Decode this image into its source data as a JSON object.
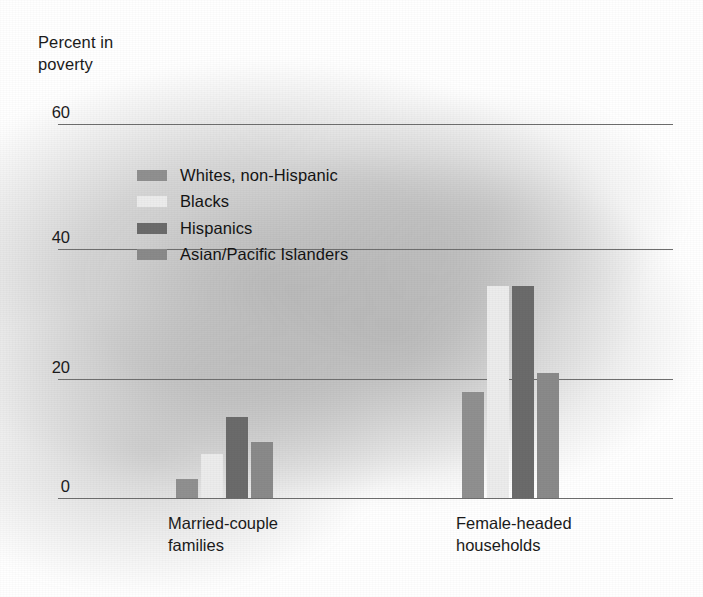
{
  "chart_data": {
    "type": "bar",
    "title": "Percent in poverty",
    "xlabel": "",
    "ylabel": "Percent in poverty",
    "ylim": [
      0,
      60
    ],
    "yticks": [
      0,
      20,
      40,
      60
    ],
    "ytick_labels": [
      "0",
      "20",
      "40",
      "60"
    ],
    "grid": true,
    "legend_position": "upper-left-inside",
    "categories": [
      "Married-couple\nfamilies",
      "Female-headed\nhouseholds"
    ],
    "category_labels": [
      "Married-couple families",
      "Female-headed households"
    ],
    "series": [
      {
        "name": "Whites, non-Hispanic",
        "color": "#909090",
        "values": [
          3,
          17
        ]
      },
      {
        "name": "Blacks",
        "color": "#ececec",
        "values": [
          7,
          34
        ]
      },
      {
        "name": "Hispanics",
        "color": "#6b6b6b",
        "values": [
          13,
          34
        ]
      },
      {
        "name": "Asian/Pacific Islanders",
        "color": "#8a8a8a",
        "values": [
          9,
          20
        ]
      }
    ]
  },
  "axis": {
    "title_text": "Percent in\npoverty",
    "tick_60": "60",
    "tick_40": "40",
    "tick_20": "20",
    "tick_0": "0"
  },
  "legend": {
    "item_0": "Whites, non-Hispanic",
    "item_1": "Blacks",
    "item_2": "Hispanics",
    "item_3": "Asian/Pacific Islanders"
  },
  "xlabels": {
    "group_0": "Married-couple\nfamilies",
    "group_1": "Female-headed\nhouseholds"
  },
  "colors": {
    "whites": "#909090",
    "blacks": "#ececec",
    "hispanics": "#6b6b6b",
    "asian": "#8a8a8a",
    "gridline": "#6e6e6e",
    "text": "#1b1b1b"
  }
}
